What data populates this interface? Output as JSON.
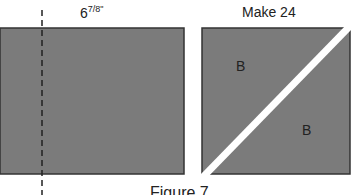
{
  "figure": {
    "left_label": "6⅞\"",
    "left_label_whole": "6",
    "left_label_frac": "7/8\"",
    "right_label": "Make 24",
    "piece_label_top": "B",
    "piece_label_bottom": "B",
    "caption": "Figure 7",
    "colors": {
      "fabric": "#7b7b7b",
      "outline": "#333333",
      "cut_line": "#ffffff",
      "dashed_line": "#222222"
    }
  }
}
